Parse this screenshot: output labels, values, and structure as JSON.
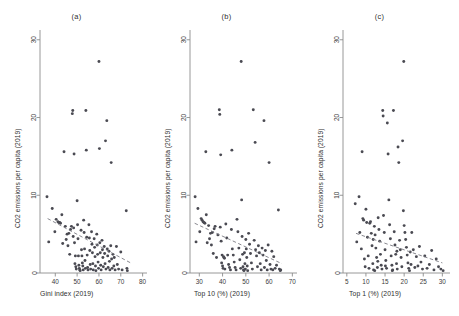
{
  "figure": {
    "background": "#ffffff",
    "point_color": "#4a4a52",
    "line_color": "#7a7a82",
    "axis_color": "#8c8c8c"
  },
  "chart_data": [
    {
      "type": "scatter",
      "panel_label": "(a)",
      "title": "",
      "xlabel": "Gini index (2019)",
      "ylabel": "CO2 emissions per capita (2019)",
      "xlim": [
        33,
        82
      ],
      "ylim": [
        0,
        31
      ],
      "xticks": [
        40,
        50,
        60,
        70,
        80
      ],
      "yticks": [
        0,
        10,
        20,
        30
      ],
      "grid": false,
      "legend": "none",
      "trendline": {
        "x0": 36.5,
        "y0": 7.0,
        "x1": 74.5,
        "y1": 1.3,
        "style": "dashed"
      },
      "points": [
        [
          36.2,
          9.8
        ],
        [
          37.0,
          4.0
        ],
        [
          38.6,
          8.3
        ],
        [
          39.8,
          5.3
        ],
        [
          40.4,
          6.9
        ],
        [
          41.2,
          6.6
        ],
        [
          41.6,
          6.5
        ],
        [
          42.0,
          6.5
        ],
        [
          42.4,
          6.4
        ],
        [
          43.0,
          7.5
        ],
        [
          43.4,
          3.8
        ],
        [
          44.0,
          15.6
        ],
        [
          44.6,
          6.0
        ],
        [
          45.0,
          4.3
        ],
        [
          45.4,
          5.0
        ],
        [
          45.8,
          3.5
        ],
        [
          46.2,
          5.1
        ],
        [
          46.6,
          2.4
        ],
        [
          47.0,
          5.6
        ],
        [
          47.4,
          6.0
        ],
        [
          47.8,
          20.5
        ],
        [
          48.0,
          20.9
        ],
        [
          48.2,
          4.7
        ],
        [
          48.4,
          5.8
        ],
        [
          48.6,
          15.3
        ],
        [
          48.8,
          3.9
        ],
        [
          49.0,
          1.2
        ],
        [
          49.2,
          2.2
        ],
        [
          49.4,
          0.8
        ],
        [
          49.6,
          0.5
        ],
        [
          50.0,
          9.3
        ],
        [
          50.2,
          6.2
        ],
        [
          50.4,
          4.4
        ],
        [
          50.6,
          2.2
        ],
        [
          50.8,
          1.0
        ],
        [
          51.0,
          0.6
        ],
        [
          51.2,
          0.4
        ],
        [
          51.4,
          0.3
        ],
        [
          51.8,
          5.5
        ],
        [
          52.0,
          3.0
        ],
        [
          52.2,
          2.2
        ],
        [
          52.4,
          1.3
        ],
        [
          52.6,
          0.9
        ],
        [
          52.8,
          0.4
        ],
        [
          53.0,
          6.8
        ],
        [
          53.2,
          5.2
        ],
        [
          53.4,
          3.1
        ],
        [
          53.6,
          1.6
        ],
        [
          53.8,
          0.6
        ],
        [
          54.0,
          20.9
        ],
        [
          54.2,
          15.8
        ],
        [
          54.4,
          4.6
        ],
        [
          54.6,
          2.3
        ],
        [
          54.8,
          0.7
        ],
        [
          55.0,
          0.4
        ],
        [
          55.4,
          6.2
        ],
        [
          55.6,
          4.5
        ],
        [
          55.8,
          2.9
        ],
        [
          56.0,
          1.1
        ],
        [
          56.2,
          0.5
        ],
        [
          56.6,
          5.3
        ],
        [
          56.8,
          3.7
        ],
        [
          57.0,
          2.6
        ],
        [
          57.2,
          1.2
        ],
        [
          57.4,
          0.4
        ],
        [
          57.8,
          4.4
        ],
        [
          58.0,
          3.3
        ],
        [
          58.2,
          2.1
        ],
        [
          58.4,
          0.9
        ],
        [
          58.6,
          0.3
        ],
        [
          59.0,
          5.0
        ],
        [
          59.2,
          3.6
        ],
        [
          59.4,
          2.4
        ],
        [
          59.6,
          1.4
        ],
        [
          59.8,
          0.6
        ],
        [
          60.0,
          27.2
        ],
        [
          60.2,
          16.0
        ],
        [
          60.4,
          3.9
        ],
        [
          60.6,
          2.6
        ],
        [
          60.8,
          1.0
        ],
        [
          61.0,
          0.4
        ],
        [
          61.4,
          4.2
        ],
        [
          61.6,
          3.0
        ],
        [
          61.8,
          2.0
        ],
        [
          62.0,
          0.8
        ],
        [
          62.4,
          3.4
        ],
        [
          62.6,
          2.5
        ],
        [
          62.8,
          1.2
        ],
        [
          63.0,
          17.0
        ],
        [
          63.2,
          0.5
        ],
        [
          63.6,
          19.6
        ],
        [
          63.8,
          3.1
        ],
        [
          64.0,
          2.2
        ],
        [
          64.2,
          0.7
        ],
        [
          64.6,
          2.8
        ],
        [
          64.8,
          1.5
        ],
        [
          65.0,
          0.4
        ],
        [
          65.4,
          3.5
        ],
        [
          65.6,
          14.2
        ],
        [
          65.8,
          1.8
        ],
        [
          66.0,
          0.6
        ],
        [
          66.4,
          2.4
        ],
        [
          66.8,
          0.9
        ],
        [
          67.0,
          2.0
        ],
        [
          67.4,
          0.4
        ],
        [
          68.0,
          3.4
        ],
        [
          68.4,
          1.1
        ],
        [
          69.0,
          0.5
        ],
        [
          70.0,
          2.7
        ],
        [
          70.6,
          0.4
        ],
        [
          72.5,
          8.0
        ],
        [
          72.8,
          0.6
        ],
        [
          73.0,
          0.3
        ]
      ]
    },
    {
      "type": "scatter",
      "panel_label": "(b)",
      "title": "",
      "xlabel": "Top 10 (%) (2019)",
      "ylabel": "CO2 emissions per capita (2019)",
      "xlim": [
        26,
        72
      ],
      "ylim": [
        0,
        31
      ],
      "xticks": [
        30,
        40,
        50,
        60,
        70
      ],
      "yticks": [
        0,
        10,
        20,
        30
      ],
      "grid": false,
      "legend": "none",
      "trendline": {
        "x0": 28.0,
        "y0": 6.4,
        "x1": 65.5,
        "y1": 1.2,
        "style": "dashed"
      },
      "points": [
        [
          28.2,
          9.8
        ],
        [
          28.6,
          4.0
        ],
        [
          29.4,
          8.3
        ],
        [
          30.2,
          5.3
        ],
        [
          30.8,
          7.0
        ],
        [
          31.2,
          6.8
        ],
        [
          31.6,
          6.6
        ],
        [
          32.0,
          6.5
        ],
        [
          32.4,
          6.4
        ],
        [
          32.8,
          15.6
        ],
        [
          33.0,
          7.5
        ],
        [
          33.4,
          3.9
        ],
        [
          34.0,
          6.1
        ],
        [
          34.4,
          4.4
        ],
        [
          34.8,
          5.1
        ],
        [
          35.2,
          3.6
        ],
        [
          35.6,
          5.2
        ],
        [
          36.0,
          2.5
        ],
        [
          36.4,
          5.7
        ],
        [
          36.8,
          6.0
        ],
        [
          37.4,
          2.0
        ],
        [
          38.0,
          4.9
        ],
        [
          38.6,
          21.0
        ],
        [
          38.8,
          20.4
        ],
        [
          39.0,
          5.9
        ],
        [
          39.2,
          15.2
        ],
        [
          39.4,
          4.1
        ],
        [
          39.6,
          1.3
        ],
        [
          39.8,
          2.3
        ],
        [
          40.0,
          0.9
        ],
        [
          40.2,
          0.6
        ],
        [
          40.4,
          2.1
        ],
        [
          40.6,
          2.0
        ],
        [
          40.8,
          1.9
        ],
        [
          41.0,
          0.5
        ],
        [
          41.4,
          6.3
        ],
        [
          41.8,
          4.5
        ],
        [
          42.2,
          2.3
        ],
        [
          42.6,
          1.1
        ],
        [
          43.0,
          0.7
        ],
        [
          43.4,
          0.4
        ],
        [
          43.8,
          5.6
        ],
        [
          44.0,
          15.8
        ],
        [
          44.2,
          3.1
        ],
        [
          44.6,
          2.3
        ],
        [
          45.0,
          1.4
        ],
        [
          45.4,
          0.7
        ],
        [
          45.8,
          0.4
        ],
        [
          46.2,
          6.9
        ],
        [
          46.6,
          5.3
        ],
        [
          47.0,
          3.2
        ],
        [
          47.4,
          1.7
        ],
        [
          47.8,
          0.6
        ],
        [
          48.0,
          27.2
        ],
        [
          48.2,
          9.4
        ],
        [
          48.4,
          4.7
        ],
        [
          48.6,
          2.4
        ],
        [
          48.8,
          0.8
        ],
        [
          49.0,
          0.4
        ],
        [
          49.2,
          0.3
        ],
        [
          49.4,
          2.6
        ],
        [
          49.6,
          1.2
        ],
        [
          49.8,
          0.5
        ],
        [
          50.0,
          4.3
        ],
        [
          50.2,
          3.1
        ],
        [
          50.4,
          2.0
        ],
        [
          50.6,
          0.9
        ],
        [
          50.8,
          0.3
        ],
        [
          51.2,
          5.1
        ],
        [
          51.6,
          3.7
        ],
        [
          52.0,
          2.5
        ],
        [
          52.4,
          1.3
        ],
        [
          52.8,
          0.5
        ],
        [
          53.2,
          21.0
        ],
        [
          53.6,
          4.2
        ],
        [
          54.0,
          16.8
        ],
        [
          54.2,
          3.0
        ],
        [
          54.6,
          2.2
        ],
        [
          55.0,
          0.8
        ],
        [
          55.4,
          3.5
        ],
        [
          55.8,
          2.6
        ],
        [
          56.2,
          1.2
        ],
        [
          56.6,
          0.4
        ],
        [
          57.0,
          3.2
        ],
        [
          57.4,
          2.3
        ],
        [
          57.8,
          19.6
        ],
        [
          58.0,
          0.7
        ],
        [
          58.4,
          2.9
        ],
        [
          58.8,
          1.6
        ],
        [
          59.2,
          0.4
        ],
        [
          59.6,
          3.6
        ],
        [
          60.0,
          14.2
        ],
        [
          60.4,
          1.1
        ],
        [
          60.8,
          0.5
        ],
        [
          61.2,
          2.8
        ],
        [
          61.6,
          0.4
        ],
        [
          62.0,
          2.1
        ],
        [
          62.6,
          0.6
        ],
        [
          63.2,
          1.0
        ],
        [
          64.0,
          8.1
        ],
        [
          64.4,
          0.5
        ],
        [
          64.8,
          0.3
        ],
        [
          65.0,
          0.4
        ]
      ]
    },
    {
      "type": "scatter",
      "panel_label": "(c)",
      "title": "",
      "xlabel": "Top 1 (%) (2019)",
      "ylabel": "CO2 emissions per capita (2019)",
      "xlim": [
        4,
        32
      ],
      "ylim": [
        0,
        31
      ],
      "xticks": [
        5,
        10,
        15,
        20,
        25,
        30
      ],
      "yticks": [
        0,
        10,
        20,
        30
      ],
      "grid": false,
      "legend": "none",
      "trendline": {
        "x0": 7.4,
        "y0": 5.1,
        "x1": 30.0,
        "y1": 1.3,
        "style": "dashed"
      },
      "points": [
        [
          7.2,
          8.9
        ],
        [
          7.6,
          4.0
        ],
        [
          8.2,
          9.8
        ],
        [
          8.4,
          5.2
        ],
        [
          8.8,
          3.1
        ],
        [
          9.0,
          15.6
        ],
        [
          9.2,
          7.0
        ],
        [
          9.4,
          6.8
        ],
        [
          9.6,
          1.8
        ],
        [
          9.8,
          0.8
        ],
        [
          10.0,
          8.2
        ],
        [
          10.2,
          6.5
        ],
        [
          10.4,
          4.6
        ],
        [
          10.6,
          2.2
        ],
        [
          10.8,
          0.6
        ],
        [
          11.0,
          6.4
        ],
        [
          11.2,
          6.6
        ],
        [
          11.4,
          5.1
        ],
        [
          11.6,
          3.5
        ],
        [
          11.8,
          1.2
        ],
        [
          12.0,
          0.4
        ],
        [
          12.2,
          6.0
        ],
        [
          12.4,
          4.9
        ],
        [
          12.6,
          3.2
        ],
        [
          12.8,
          2.0
        ],
        [
          13.0,
          0.7
        ],
        [
          13.2,
          7.1
        ],
        [
          13.4,
          5.6
        ],
        [
          13.6,
          4.1
        ],
        [
          13.8,
          2.4
        ],
        [
          14.0,
          1.0
        ],
        [
          14.2,
          0.5
        ],
        [
          14.4,
          20.9
        ],
        [
          14.5,
          20.2
        ],
        [
          14.6,
          7.4
        ],
        [
          14.8,
          5.2
        ],
        [
          15.0,
          3.0
        ],
        [
          15.2,
          1.6
        ],
        [
          15.4,
          0.6
        ],
        [
          15.6,
          19.3
        ],
        [
          15.8,
          15.3
        ],
        [
          16.0,
          9.4
        ],
        [
          16.2,
          6.2
        ],
        [
          16.4,
          4.4
        ],
        [
          16.6,
          2.2
        ],
        [
          16.8,
          1.0
        ],
        [
          17.0,
          0.4
        ],
        [
          17.2,
          20.9
        ],
        [
          17.4,
          5.3
        ],
        [
          17.6,
          3.6
        ],
        [
          17.8,
          2.4
        ],
        [
          18.0,
          1.2
        ],
        [
          18.2,
          0.5
        ],
        [
          18.4,
          16.2
        ],
        [
          18.6,
          14.2
        ],
        [
          18.8,
          4.2
        ],
        [
          19.0,
          3.0
        ],
        [
          19.2,
          2.0
        ],
        [
          19.4,
          0.8
        ],
        [
          19.6,
          17.0
        ],
        [
          19.8,
          8.0
        ],
        [
          20.0,
          6.1
        ],
        [
          20.2,
          5.2
        ],
        [
          20.4,
          4.3
        ],
        [
          20.6,
          3.3
        ],
        [
          20.8,
          2.3
        ],
        [
          21.0,
          1.3
        ],
        [
          21.2,
          0.6
        ],
        [
          21.4,
          0.3
        ],
        [
          21.6,
          2.7
        ],
        [
          21.8,
          1.1
        ],
        [
          22.0,
          5.2
        ],
        [
          22.4,
          3.0
        ],
        [
          22.8,
          0.7
        ],
        [
          23.2,
          2.1
        ],
        [
          23.6,
          0.9
        ],
        [
          24.0,
          3.4
        ],
        [
          24.4,
          1.4
        ],
        [
          24.8,
          0.5
        ],
        [
          25.4,
          2.2
        ],
        [
          26.0,
          0.6
        ],
        [
          26.6,
          1.1
        ],
        [
          27.2,
          2.9
        ],
        [
          27.8,
          0.4
        ],
        [
          28.4,
          1.8
        ],
        [
          29.0,
          0.8
        ],
        [
          29.6,
          0.5
        ],
        [
          30.2,
          0.3
        ],
        [
          19.9,
          27.2
        ],
        [
          11.9,
          4.3
        ],
        [
          13.1,
          1.5
        ],
        [
          15.1,
          0.9
        ],
        [
          16.9,
          0.3
        ],
        [
          18.1,
          2.8
        ],
        [
          12.3,
          0.3
        ]
      ]
    }
  ]
}
